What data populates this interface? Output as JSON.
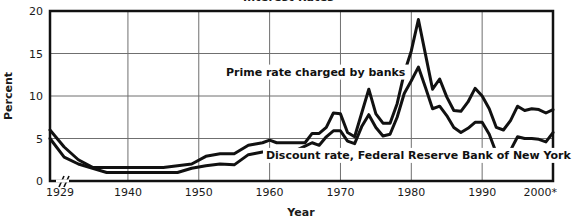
{
  "chart_data": {
    "type": "line",
    "title": "Interest Rates",
    "xlabel": "Year",
    "ylabel": "Percent",
    "xlim": [
      1929,
      2000
    ],
    "ylim": [
      0,
      20
    ],
    "xticks": [
      "1929",
      "1940",
      "1950",
      "1960",
      "1970",
      "1980",
      "1990",
      "2000*"
    ],
    "xtick_values": [
      1929,
      1940,
      1950,
      1960,
      1970,
      1980,
      1990,
      2000
    ],
    "yticks": [
      "0",
      "5",
      "10",
      "15",
      "20"
    ],
    "ytick_values": [
      0,
      5,
      10,
      15,
      20
    ],
    "grid": true,
    "axis_break": true,
    "legend": "inline-labels",
    "series": [
      {
        "name": "Prime rate charged by banks",
        "label_x": 1966.5,
        "label_y": 12.4,
        "x": [
          1929,
          1931,
          1933,
          1935,
          1937,
          1940,
          1942,
          1945,
          1947,
          1949,
          1951,
          1953,
          1955,
          1957,
          1959,
          1960,
          1961,
          1962,
          1963,
          1965,
          1966,
          1967,
          1968,
          1969,
          1970,
          1971,
          1972,
          1973,
          1974,
          1975,
          1976,
          1977,
          1978,
          1979,
          1980,
          1981,
          1982,
          1983,
          1984,
          1985,
          1986,
          1987,
          1988,
          1989,
          1990,
          1991,
          1992,
          1993,
          1994,
          1995,
          1996,
          1997,
          1998,
          1999,
          2000
        ],
        "values": [
          6.0,
          4.0,
          2.5,
          1.6,
          1.6,
          1.6,
          1.6,
          1.6,
          1.8,
          2.0,
          2.9,
          3.2,
          3.2,
          4.2,
          4.5,
          4.8,
          4.5,
          4.5,
          4.5,
          4.5,
          5.6,
          5.6,
          6.3,
          8.0,
          7.9,
          5.7,
          5.2,
          8.0,
          10.8,
          7.9,
          6.8,
          6.8,
          9.1,
          12.7,
          15.3,
          19.0,
          14.9,
          10.8,
          12.0,
          9.9,
          8.3,
          8.2,
          9.3,
          10.9,
          10.0,
          8.5,
          6.3,
          6.0,
          7.1,
          8.8,
          8.3,
          8.5,
          8.4,
          8.0,
          8.4
        ],
        "linewidth": 3,
        "color": "#111111"
      },
      {
        "name": "Discount rate, Federal Reserve Bank of New York",
        "label_x": 1981.0,
        "label_y": 2.6,
        "x": [
          1929,
          1931,
          1933,
          1935,
          1937,
          1940,
          1942,
          1945,
          1947,
          1949,
          1951,
          1953,
          1955,
          1957,
          1959,
          1960,
          1961,
          1962,
          1963,
          1965,
          1966,
          1967,
          1968,
          1969,
          1970,
          1971,
          1972,
          1973,
          1974,
          1975,
          1976,
          1977,
          1978,
          1979,
          1980,
          1981,
          1982,
          1983,
          1984,
          1985,
          1986,
          1987,
          1988,
          1989,
          1990,
          1991,
          1992,
          1993,
          1994,
          1995,
          1996,
          1997,
          1998,
          1999,
          2000
        ],
        "values": [
          5.0,
          2.8,
          2.0,
          1.5,
          1.0,
          1.0,
          1.0,
          1.0,
          1.0,
          1.5,
          1.8,
          2.0,
          1.9,
          3.1,
          3.4,
          3.5,
          3.0,
          3.0,
          3.3,
          4.1,
          4.5,
          4.2,
          5.2,
          5.9,
          5.9,
          4.7,
          4.4,
          6.4,
          7.8,
          6.3,
          5.3,
          5.5,
          7.5,
          10.3,
          11.8,
          13.4,
          11.0,
          8.5,
          8.8,
          7.7,
          6.3,
          5.7,
          6.2,
          6.9,
          6.9,
          5.5,
          3.3,
          3.0,
          3.6,
          5.2,
          5.0,
          5.0,
          4.9,
          4.6,
          5.7
        ],
        "linewidth": 3,
        "color": "#111111"
      }
    ]
  },
  "geometry": {
    "plot_left": 50,
    "plot_right": 553,
    "plot_top": 11,
    "plot_bottom": 181
  }
}
